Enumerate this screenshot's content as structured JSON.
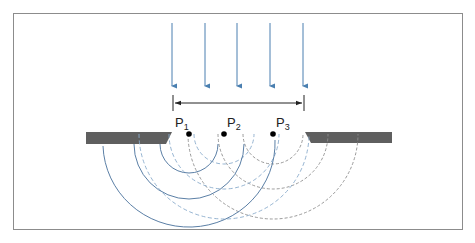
{
  "diagram": {
    "labels": {
      "p1": {
        "letter": "P",
        "sub": "1"
      },
      "p2": {
        "letter": "P",
        "sub": "2"
      },
      "p3": {
        "letter": "P",
        "sub": "3"
      }
    },
    "colors": {
      "wave_arrows": "#4a7fb0",
      "solid_arcs": "#5b7fa6",
      "dashed_blue_arcs": "#8aaccc",
      "dashed_gray_arcs": "#8e8e8e",
      "barrier": "#5f5f5f",
      "points": "#000000",
      "frame": "#8c8c8c"
    },
    "incident_arrows": 5,
    "slit_width_marker": "double-headed arrow spanning the slit",
    "sources": [
      {
        "name": "P1",
        "arcs": "solid blue",
        "radii": [
          30,
          55,
          85
        ]
      },
      {
        "name": "P2",
        "arcs": "dashed blue",
        "radii": [
          30,
          55,
          85
        ]
      },
      {
        "name": "P3",
        "arcs": "dashed gray",
        "radii": [
          30,
          55,
          85
        ]
      }
    ]
  }
}
